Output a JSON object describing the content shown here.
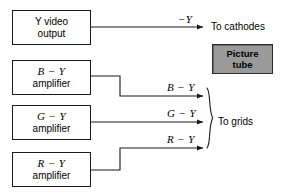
{
  "diagram": {
    "width": 281,
    "height": 195,
    "background_color": "#ffffff",
    "line_color": "#1a1a1a",
    "picture_tube_fill": "#9a9a9a"
  },
  "blocks": [
    {
      "id": "y-video",
      "line1": "Y video",
      "line2": "output",
      "style": "plain"
    },
    {
      "id": "b-y",
      "line1": "B − Y",
      "line2": "amplifier",
      "style": "signal"
    },
    {
      "id": "g-y",
      "line1": "G − Y",
      "line2": "amplifier",
      "style": "signal"
    },
    {
      "id": "r-y",
      "line1": "R − Y",
      "line2": "amplifier",
      "style": "signal"
    },
    {
      "id": "picture-tube",
      "line1": "Picture",
      "line2": "tube",
      "style": "shaded"
    }
  ],
  "wire_labels": {
    "minus_y": "−Y",
    "b_minus_y": "B − Y",
    "g_minus_y": "G − Y",
    "r_minus_y": "R − Y"
  },
  "destinations": {
    "cathodes": "To cathodes",
    "grids": "To grids"
  },
  "icons": {
    "arrowhead": "arrowhead-icon",
    "brace": "curly-brace-icon"
  }
}
